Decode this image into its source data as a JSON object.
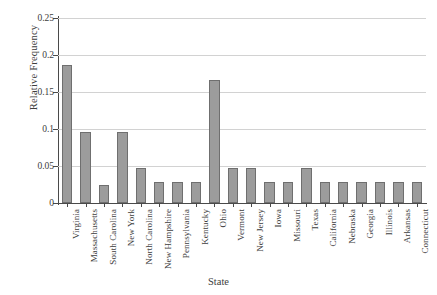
{
  "chart_data": {
    "type": "bar",
    "title": "",
    "xlabel": "State",
    "ylabel": "Relative Frequency",
    "ylim": [
      0,
      0.25
    ],
    "yticks": [
      0,
      0.05,
      0.1,
      0.15,
      0.2,
      0.25
    ],
    "ytick_labels": [
      "0",
      "0.05",
      "0.1",
      "0.15",
      "0.2",
      "0.25"
    ],
    "grid": true,
    "legend": "none",
    "categories": [
      "Virginia",
      "Massachusetts",
      "South Carolina",
      "New York",
      "North Carolina",
      "New Hampshire",
      "Pennsylvania",
      "Kentucky",
      "Ohio",
      "Vermont",
      "New Jersey",
      "Iowa",
      "Missouri",
      "Texas",
      "California",
      "Nebraska",
      "Georgia",
      "Illinois",
      "Arkansas",
      "Connecticut"
    ],
    "values": [
      0.186,
      0.096,
      0.024,
      0.096,
      0.047,
      0.028,
      0.028,
      0.028,
      0.166,
      0.047,
      0.047,
      0.028,
      0.028,
      0.047,
      0.028,
      0.028,
      0.028,
      0.028,
      0.028,
      0.028
    ],
    "colors": {
      "bar_fill": "#9c9c9c",
      "bar_edge": "#6f6f6f",
      "grid": "#d2d2d2",
      "axis": "#4a4a4a",
      "text": "#3d3d3d",
      "background": "#ffffff"
    }
  }
}
